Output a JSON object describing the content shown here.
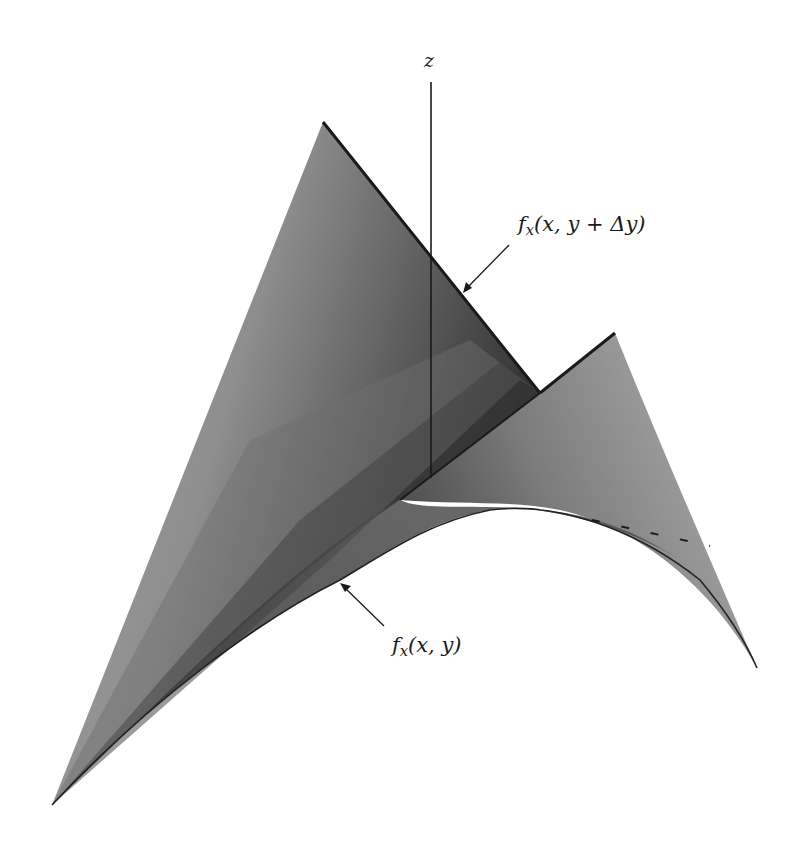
{
  "figure": {
    "type": "3d-surface-illustration",
    "axis": {
      "label": "z"
    },
    "annotations": [
      {
        "id": "upper-curve",
        "function": "f",
        "subscript": "x",
        "args": "(x, y + Δy)"
      },
      {
        "id": "lower-curve",
        "function": "f",
        "subscript": "x",
        "args": "(x, y)"
      }
    ],
    "colors": {
      "background": "#ffffff",
      "ink": "#1a1a1a",
      "surface_light": "#a8a8a8",
      "surface_mid": "#7a7a7a",
      "surface_dark": "#3a3a3a",
      "surface_darkest": "#202020"
    }
  }
}
